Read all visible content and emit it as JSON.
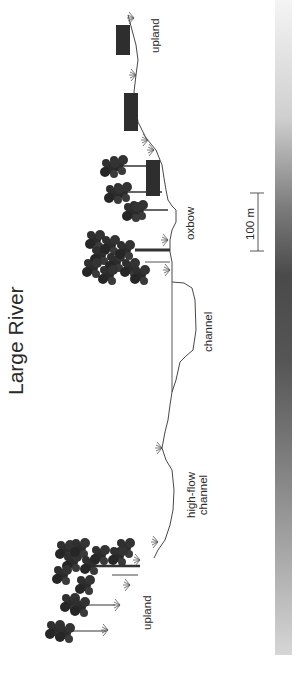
{
  "figure": {
    "title": "Large River",
    "labels": {
      "upland_top": "upland",
      "oxbow": "oxbow",
      "channel": "channel",
      "high_flow_line1": "high-flow",
      "high_flow_line2": "channel",
      "upland_bottom": "upland"
    },
    "scale_bar": {
      "label": "100 m"
    },
    "colors": {
      "vegetation": "#2b2b2b",
      "profile_line": "#333333",
      "gradient_light": "#f4f4f4",
      "gradient_dark": "#4a4a4a"
    }
  }
}
